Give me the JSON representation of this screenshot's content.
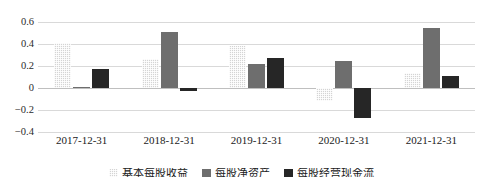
{
  "chart_data": {
    "type": "bar",
    "title": "",
    "xlabel": "",
    "ylabel": "",
    "categories": [
      "2017-12-31",
      "2018-12-31",
      "2019-12-31",
      "2020-12-31",
      "2021-12-31"
    ],
    "series": [
      {
        "name": "基本每股收益",
        "color": "#d4d4d4",
        "values": [
          0.41,
          0.26,
          0.38,
          -0.12,
          0.14
        ]
      },
      {
        "name": "每股净资产",
        "color": "#6e6e6e",
        "values": [
          0.01,
          0.51,
          0.22,
          0.25,
          0.55
        ]
      },
      {
        "name": "每股经营现金流",
        "color": "#262626",
        "values": [
          0.17,
          -0.03,
          0.27,
          -0.27,
          0.11
        ]
      }
    ],
    "ylim": [
      -0.4,
      0.6
    ],
    "yticks": [
      "0.6",
      "0.4",
      "0.2",
      "0",
      "−0.2",
      "−0.4"
    ],
    "ytick_values": [
      0.6,
      0.4,
      0.2,
      0,
      -0.2,
      -0.4
    ],
    "grid": true,
    "legend_position": "bottom"
  }
}
